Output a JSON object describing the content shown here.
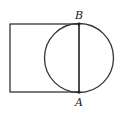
{
  "diagram": {
    "points": {
      "A": {
        "label": "A",
        "x": 79,
        "y": 92
      },
      "B": {
        "label": "B",
        "x": 79,
        "y": 24
      }
    },
    "rectangle": {
      "x": 10,
      "y": 24,
      "width": 69,
      "height": 68
    },
    "circle": {
      "cx": 79,
      "cy": 58,
      "r": 35
    },
    "colors": {
      "stroke": "#333333",
      "background": "#ffffff"
    }
  }
}
